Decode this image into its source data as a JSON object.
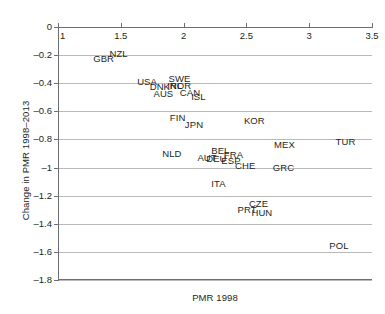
{
  "chart_data": {
    "type": "scatter",
    "title": "",
    "xlabel": "PMR 1998",
    "ylabel": "Change in PMR 1998–2013",
    "xlim": [
      1,
      3.5
    ],
    "ylim": [
      -1.8,
      0
    ],
    "grid": true,
    "grid_axis": "y",
    "x_axis_position": "top",
    "legend": "none",
    "marker_style": "country-code-text-labels",
    "xticks": [
      "1",
      "1.5",
      "2",
      "2.5",
      "3",
      "3.5"
    ],
    "xtick_values": [
      1,
      1.5,
      2,
      2.5,
      3,
      3.5
    ],
    "yticks": [
      "0",
      "–0.2",
      "–0.4",
      "–0.6",
      "–0.8",
      "–1",
      "–1.2",
      "–1.4",
      "–1.6",
      "–1.8"
    ],
    "ytick_values": [
      0,
      -0.2,
      -0.4,
      -0.6,
      -0.8,
      -1,
      -1.2,
      -1.4,
      -1.6,
      -1.8
    ],
    "points": [
      {
        "label": "GBR",
        "x": 1.28,
        "y": -0.23
      },
      {
        "label": "NZL",
        "x": 1.41,
        "y": -0.19
      },
      {
        "label": "USA",
        "x": 1.63,
        "y": -0.39
      },
      {
        "label": "DNK",
        "x": 1.73,
        "y": -0.43
      },
      {
        "label": "AUS",
        "x": 1.76,
        "y": -0.48
      },
      {
        "label": "SWE",
        "x": 1.88,
        "y": -0.37
      },
      {
        "label": "NOR",
        "x": 1.89,
        "y": -0.42
      },
      {
        "label": "IRL",
        "x": 1.87,
        "y": -0.42
      },
      {
        "label": "CAN",
        "x": 1.97,
        "y": -0.47
      },
      {
        "label": "ISL",
        "x": 2.06,
        "y": -0.5
      },
      {
        "label": "FIN",
        "x": 1.89,
        "y": -0.65
      },
      {
        "label": "JPN",
        "x": 2.01,
        "y": -0.7
      },
      {
        "label": "KOR",
        "x": 2.48,
        "y": -0.67
      },
      {
        "label": "MEX",
        "x": 2.72,
        "y": -0.84
      },
      {
        "label": "TUR",
        "x": 3.21,
        "y": -0.82
      },
      {
        "label": "NLD",
        "x": 1.83,
        "y": -0.9
      },
      {
        "label": "AUT",
        "x": 2.11,
        "y": -0.93
      },
      {
        "label": "BEL",
        "x": 2.22,
        "y": -0.88
      },
      {
        "label": "DEU",
        "x": 2.18,
        "y": -0.94
      },
      {
        "label": "FRA",
        "x": 2.32,
        "y": -0.91
      },
      {
        "label": "ESP",
        "x": 2.3,
        "y": -0.95
      },
      {
        "label": "CHE",
        "x": 2.41,
        "y": -0.99
      },
      {
        "label": "GRC",
        "x": 2.71,
        "y": -1.0
      },
      {
        "label": "ITA",
        "x": 2.22,
        "y": -1.12
      },
      {
        "label": "PRT",
        "x": 2.43,
        "y": -1.3
      },
      {
        "label": "CZE",
        "x": 2.52,
        "y": -1.26
      },
      {
        "label": "HUN",
        "x": 2.54,
        "y": -1.32
      },
      {
        "label": "POL",
        "x": 3.16,
        "y": -1.56
      }
    ]
  }
}
